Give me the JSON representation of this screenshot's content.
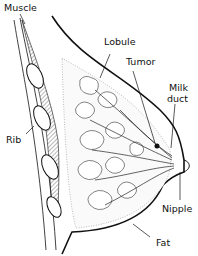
{
  "figure": {
    "type": "anatomical-diagram",
    "labels": {
      "muscle": "Muscle",
      "lobule": "Lobule",
      "tumor": "Tumor",
      "milk_duct_line1": "Milk",
      "milk_duct_line2": "duct",
      "rib": "Rib",
      "nipple": "Nipple",
      "fat": "Fat"
    }
  }
}
